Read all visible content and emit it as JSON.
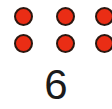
{
  "card": {
    "kind": "counting-flashcard",
    "background_color": "#ffffff"
  },
  "dots": {
    "total_count": 6,
    "rows": 2,
    "columns": 3,
    "fill_color": "#ea2d15",
    "outline_color": "#2b1710",
    "grid": [
      [
        "dot",
        "dot",
        "dot"
      ],
      [
        "dot",
        "dot",
        "dot"
      ]
    ]
  },
  "numeral": {
    "value": "6",
    "color": "#1b1b1b"
  }
}
